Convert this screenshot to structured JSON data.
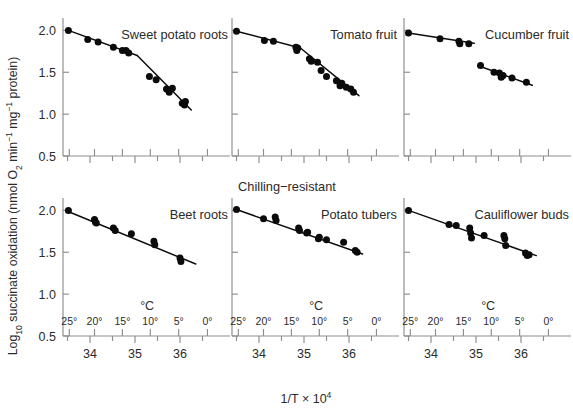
{
  "figure": {
    "ylabel": "Log₁₀ succinate oxidation (nmol O₂ min⁻¹ mg⁻¹ protein)",
    "xlabel": "1/T × 10⁴",
    "temp_axis_label": "°C",
    "group_label": "Chilling−resistant",
    "accent": "#0b0b0b",
    "axis_color": "#8d8d8d"
  },
  "axes": {
    "y_ticks": [
      "2.0",
      "1.5",
      "1.0",
      "0.5"
    ],
    "y_tick_values": [
      2.0,
      1.5,
      1.0,
      0.5
    ],
    "ylim": [
      0.5,
      2.1
    ],
    "xlim": [
      33.4,
      36.8
    ],
    "x_ticks_invT": [
      "34",
      "35",
      "36"
    ],
    "x_tick_values_invT": [
      34,
      35,
      36
    ],
    "x_minor_invT": [
      33.5,
      34.5,
      35.5,
      36.5
    ],
    "temp_ticks": [
      "25°",
      "20°",
      "15°",
      "10°",
      "5°",
      "0°"
    ],
    "temp_tick_invT": [
      33.54,
      33.11,
      34.72,
      35.34,
      35.97,
      36.61
    ]
  },
  "chart_data": {
    "type": "scatter",
    "title": "",
    "xlabel": "1/T × 10⁴",
    "ylabel": "Log₁₀ succinate oxidation (nmol O₂ min⁻¹ mg⁻¹ protein)",
    "xlim": [
      33.4,
      36.8
    ],
    "ylim": [
      0.5,
      2.1
    ],
    "grid": false,
    "legend": "none",
    "panels": [
      {
        "name": "sweet-potato-roots",
        "title": "Sweet potato roots",
        "row": 0,
        "col": 0,
        "break_point": {
          "x": 35.05,
          "y": 1.69
        },
        "points": [
          {
            "x": 33.52,
            "y": 2.0
          },
          {
            "x": 33.95,
            "y": 1.89
          },
          {
            "x": 34.18,
            "y": 1.86
          },
          {
            "x": 34.52,
            "y": 1.8
          },
          {
            "x": 34.72,
            "y": 1.76
          },
          {
            "x": 34.8,
            "y": 1.76
          },
          {
            "x": 34.86,
            "y": 1.73
          },
          {
            "x": 35.32,
            "y": 1.45
          },
          {
            "x": 35.47,
            "y": 1.41
          },
          {
            "x": 35.7,
            "y": 1.3
          },
          {
            "x": 35.76,
            "y": 1.26
          },
          {
            "x": 35.83,
            "y": 1.31
          },
          {
            "x": 36.05,
            "y": 1.13
          },
          {
            "x": 36.1,
            "y": 1.11
          },
          {
            "x": 36.12,
            "y": 1.15
          }
        ],
        "fit_segments": [
          [
            {
              "x": 33.52,
              "y": 2.0
            },
            {
              "x": 35.05,
              "y": 1.7
            }
          ],
          [
            {
              "x": 35.05,
              "y": 1.7
            },
            {
              "x": 36.25,
              "y": 1.05
            }
          ]
        ]
      },
      {
        "name": "tomato-fruit",
        "title": "Tomato fruit",
        "row": 0,
        "col": 1,
        "break_point": {
          "x": 34.88,
          "y": 1.77
        },
        "points": [
          {
            "x": 33.5,
            "y": 1.99
          },
          {
            "x": 34.12,
            "y": 1.88
          },
          {
            "x": 34.32,
            "y": 1.87
          },
          {
            "x": 34.82,
            "y": 1.8
          },
          {
            "x": 34.84,
            "y": 1.76
          },
          {
            "x": 34.86,
            "y": 1.79
          },
          {
            "x": 35.12,
            "y": 1.66
          },
          {
            "x": 35.16,
            "y": 1.63
          },
          {
            "x": 35.3,
            "y": 1.62
          },
          {
            "x": 35.38,
            "y": 1.52
          },
          {
            "x": 35.5,
            "y": 1.45
          },
          {
            "x": 35.72,
            "y": 1.4
          },
          {
            "x": 35.8,
            "y": 1.34
          },
          {
            "x": 35.84,
            "y": 1.37
          },
          {
            "x": 35.94,
            "y": 1.32
          },
          {
            "x": 36.04,
            "y": 1.3
          },
          {
            "x": 36.1,
            "y": 1.26
          }
        ],
        "fit_segments": [
          [
            {
              "x": 33.5,
              "y": 1.99
            },
            {
              "x": 34.92,
              "y": 1.79
            }
          ],
          [
            {
              "x": 34.92,
              "y": 1.79
            },
            {
              "x": 36.22,
              "y": 1.22
            }
          ]
        ]
      },
      {
        "name": "cucumber-fruit",
        "title": "Cucumber fruit",
        "row": 0,
        "col": 2,
        "discontinuous": true,
        "points": [
          {
            "x": 33.5,
            "y": 1.97
          },
          {
            "x": 34.2,
            "y": 1.9
          },
          {
            "x": 34.62,
            "y": 1.87
          },
          {
            "x": 34.64,
            "y": 1.84
          },
          {
            "x": 34.84,
            "y": 1.84
          },
          {
            "x": 35.1,
            "y": 1.58
          },
          {
            "x": 35.4,
            "y": 1.5
          },
          {
            "x": 35.52,
            "y": 1.49
          },
          {
            "x": 35.56,
            "y": 1.44
          },
          {
            "x": 35.6,
            "y": 1.46
          },
          {
            "x": 35.8,
            "y": 1.43
          },
          {
            "x": 36.12,
            "y": 1.38
          }
        ],
        "fit_segments": [
          [
            {
              "x": 33.5,
              "y": 1.97
            },
            {
              "x": 34.96,
              "y": 1.845
            }
          ],
          [
            {
              "x": 35.04,
              "y": 1.58
            },
            {
              "x": 36.25,
              "y": 1.345
            }
          ]
        ]
      },
      {
        "name": "beet-roots",
        "title": "Beet roots",
        "row": 1,
        "col": 0,
        "points": [
          {
            "x": 33.52,
            "y": 2.0
          },
          {
            "x": 34.1,
            "y": 1.89
          },
          {
            "x": 34.12,
            "y": 1.86
          },
          {
            "x": 34.14,
            "y": 1.85
          },
          {
            "x": 34.52,
            "y": 1.79
          },
          {
            "x": 34.56,
            "y": 1.76
          },
          {
            "x": 34.92,
            "y": 1.72
          },
          {
            "x": 35.42,
            "y": 1.63
          },
          {
            "x": 35.44,
            "y": 1.59
          },
          {
            "x": 36.0,
            "y": 1.43
          },
          {
            "x": 36.02,
            "y": 1.39
          }
        ],
        "fit_segments": [
          [
            {
              "x": 33.5,
              "y": 1.99
            },
            {
              "x": 36.35,
              "y": 1.36
            }
          ]
        ]
      },
      {
        "name": "potato-tubers",
        "title": "Potato tubers",
        "row": 1,
        "col": 1,
        "points": [
          {
            "x": 33.5,
            "y": 2.01
          },
          {
            "x": 34.1,
            "y": 1.9
          },
          {
            "x": 34.36,
            "y": 1.92
          },
          {
            "x": 34.38,
            "y": 1.88
          },
          {
            "x": 34.88,
            "y": 1.79
          },
          {
            "x": 34.9,
            "y": 1.76
          },
          {
            "x": 35.06,
            "y": 1.73
          },
          {
            "x": 35.08,
            "y": 1.74
          },
          {
            "x": 35.32,
            "y": 1.66
          },
          {
            "x": 35.34,
            "y": 1.68
          },
          {
            "x": 35.5,
            "y": 1.65
          },
          {
            "x": 35.88,
            "y": 1.62
          },
          {
            "x": 36.14,
            "y": 1.52
          },
          {
            "x": 36.18,
            "y": 1.5
          }
        ],
        "fit_segments": [
          [
            {
              "x": 33.5,
              "y": 2.01
            },
            {
              "x": 36.3,
              "y": 1.48
            }
          ]
        ]
      },
      {
        "name": "cauliflower-buds",
        "title": "Cauliflower buds",
        "row": 1,
        "col": 2,
        "points": [
          {
            "x": 33.5,
            "y": 2.0
          },
          {
            "x": 34.4,
            "y": 1.83
          },
          {
            "x": 34.56,
            "y": 1.82
          },
          {
            "x": 34.86,
            "y": 1.79
          },
          {
            "x": 34.88,
            "y": 1.73
          },
          {
            "x": 34.9,
            "y": 1.67
          },
          {
            "x": 35.18,
            "y": 1.7
          },
          {
            "x": 35.62,
            "y": 1.7
          },
          {
            "x": 35.64,
            "y": 1.66
          },
          {
            "x": 35.66,
            "y": 1.58
          },
          {
            "x": 36.1,
            "y": 1.49
          },
          {
            "x": 36.14,
            "y": 1.46
          },
          {
            "x": 36.18,
            "y": 1.47
          }
        ],
        "fit_segments": [
          [
            {
              "x": 33.5,
              "y": 2.0
            },
            {
              "x": 36.34,
              "y": 1.46
            }
          ]
        ]
      }
    ]
  }
}
